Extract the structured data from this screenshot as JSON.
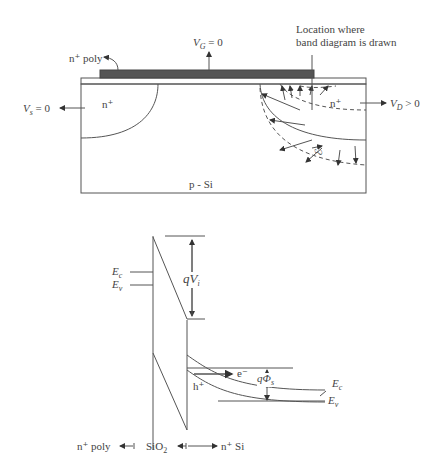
{
  "cross_section": {
    "gate_material": "n⁺ poly",
    "gate_voltage": {
      "symbol": "V",
      "sub": "G",
      "rel": "= 0"
    },
    "source_voltage": {
      "symbol": "V",
      "sub": "s",
      "rel": "= 0"
    },
    "drain_voltage": {
      "symbol": "V",
      "sub": "D",
      "rel": "> 0"
    },
    "source_region": "n⁺",
    "drain_region": "n⁺",
    "substrate": "p - Si",
    "annotation_line1": "Location where",
    "annotation_line2": "band diagram is drawn",
    "field_symbol": "ℰ"
  },
  "band_diagram": {
    "ec_left": {
      "symbol": "E",
      "sub": "c"
    },
    "ev_left": {
      "symbol": "E",
      "sub": "v"
    },
    "oxide_drop": {
      "prefix": "q",
      "symbol": "V",
      "sub": "i"
    },
    "electron": "e⁻",
    "hole": "h⁺",
    "surface_potential": {
      "prefix": "q",
      "symbol": "Φ",
      "sub": "s"
    },
    "ec_right": {
      "symbol": "E",
      "sub": "c"
    },
    "ev_right": {
      "symbol": "E",
      "sub": "v"
    }
  },
  "bottom_labels": {
    "left": "n⁺ poly",
    "middle_base": "SiO",
    "middle_sub": "2",
    "right": "n⁺ Si"
  }
}
